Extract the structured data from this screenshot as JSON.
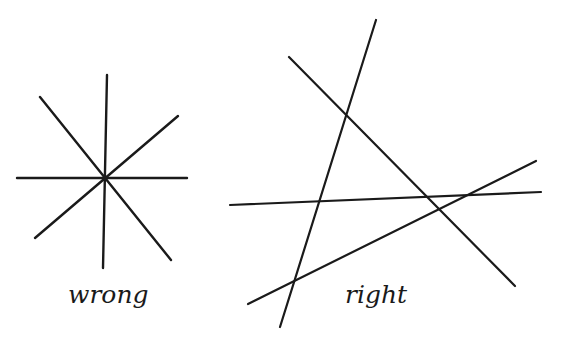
{
  "diagram": {
    "stroke_color": "#1a1a1a",
    "figures": [
      {
        "id": "wrong",
        "label": "wrong",
        "description": "four lines all intersecting at a single common point",
        "lines": [
          {
            "x1": 107,
            "y1": 75,
            "x2": 103,
            "y2": 268
          },
          {
            "x1": 17,
            "y1": 178,
            "x2": 187,
            "y2": 178
          },
          {
            "x1": 40,
            "y1": 97,
            "x2": 171,
            "y2": 260
          },
          {
            "x1": 178,
            "y1": 116,
            "x2": 35,
            "y2": 238
          }
        ]
      },
      {
        "id": "right",
        "label": "right",
        "description": "four lines in general position, each pair intersecting at a distinct point",
        "lines": [
          {
            "x1": 376,
            "y1": 20,
            "x2": 280,
            "y2": 327
          },
          {
            "x1": 289,
            "y1": 57,
            "x2": 515,
            "y2": 286
          },
          {
            "x1": 230,
            "y1": 205,
            "x2": 541,
            "y2": 192
          },
          {
            "x1": 248,
            "y1": 304,
            "x2": 536,
            "y2": 161
          }
        ]
      }
    ]
  }
}
